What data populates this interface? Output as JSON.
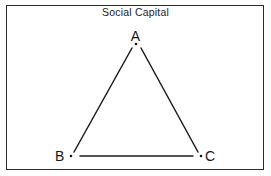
{
  "figure": {
    "title": "Social Capital",
    "background_color": "#ffffff",
    "frame_color": "#2b2b2b",
    "line_color": "#1d1d1d"
  },
  "diagram": {
    "type": "triangle-network",
    "nodes": [
      {
        "id": "A",
        "label": "A",
        "x": 136,
        "y": 44
      },
      {
        "id": "B",
        "label": "B",
        "x": 71,
        "y": 156
      },
      {
        "id": "C",
        "label": "C",
        "x": 201,
        "y": 156
      }
    ],
    "edges": [
      {
        "from": "A",
        "to": "B"
      },
      {
        "from": "A",
        "to": "C"
      },
      {
        "from": "B",
        "to": "C"
      }
    ]
  }
}
